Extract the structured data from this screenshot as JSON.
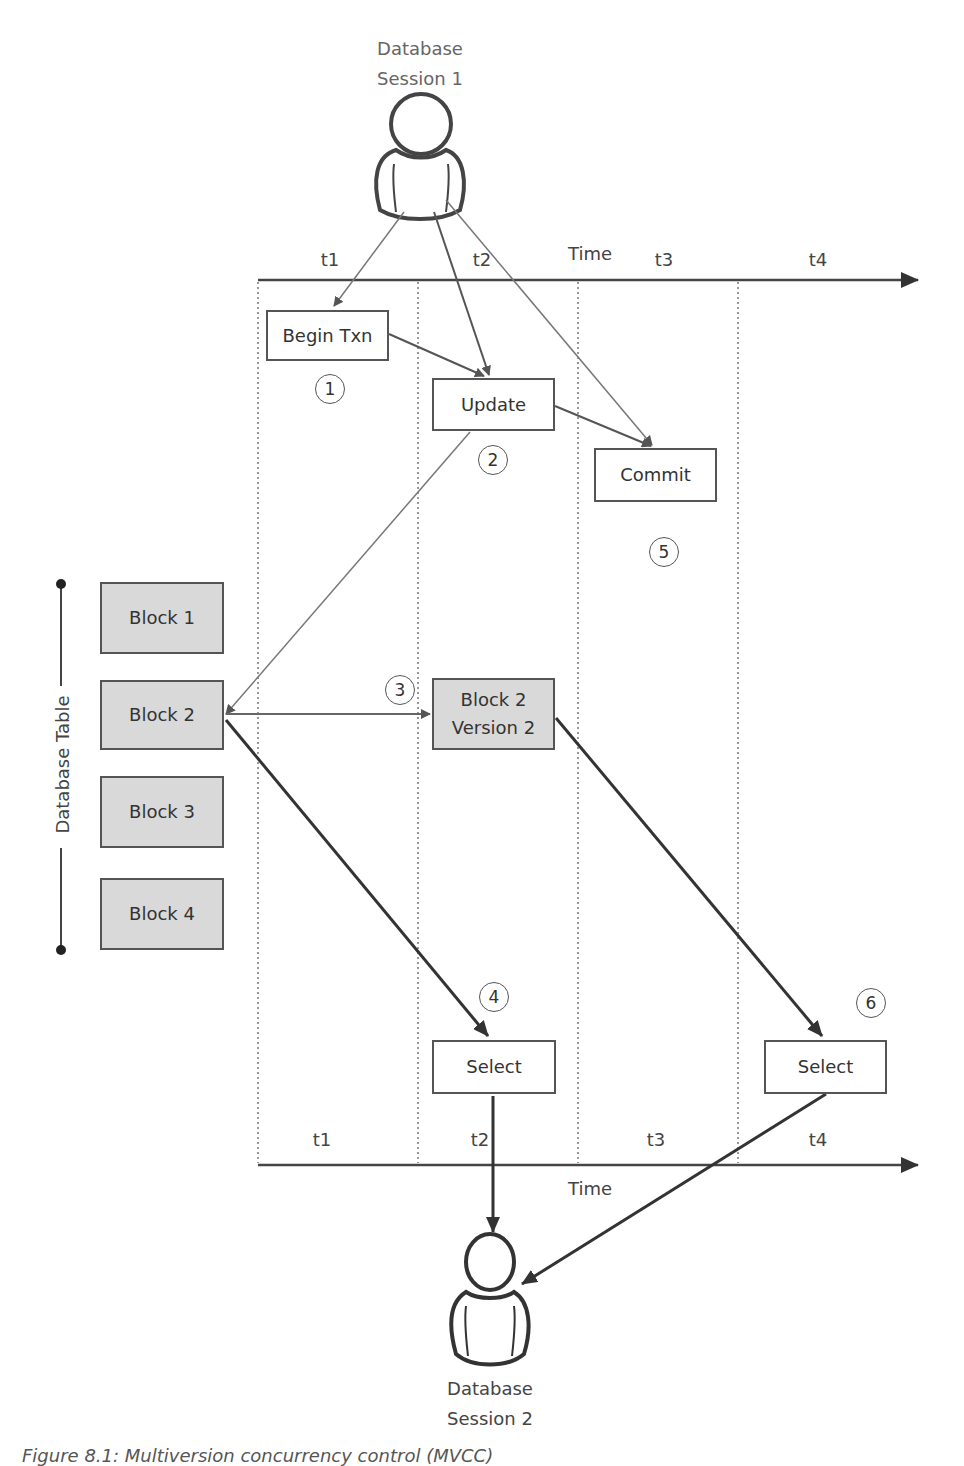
{
  "session1": {
    "line1": "Database",
    "line2": "Session 1"
  },
  "session2": {
    "line1": "Database",
    "line2": "Session 2"
  },
  "top_axis": {
    "label": "Time",
    "ticks": [
      "t1",
      "t2",
      "t3",
      "t4"
    ]
  },
  "bottom_axis": {
    "label": "Time",
    "ticks": [
      "t1",
      "t2",
      "t3",
      "t4"
    ]
  },
  "table": {
    "label": "Database Table",
    "blocks": [
      "Block 1",
      "Block 2",
      "Block 3",
      "Block 4"
    ]
  },
  "steps": {
    "begin_txn": "Begin Txn",
    "update": "Update",
    "commit": "Commit",
    "block2_v2_line1": "Block 2",
    "block2_v2_line2": "Version 2",
    "select1": "Select",
    "select2": "Select"
  },
  "markers": [
    "1",
    "2",
    "3",
    "4",
    "5",
    "6"
  ],
  "caption": "Figure 8.1: Multiversion concurrency control (MVCC)",
  "colors": {
    "box_fill": "#ffffff",
    "block_fill": "#d9d9d9",
    "line": "#555555",
    "thin_line": "#777777"
  }
}
